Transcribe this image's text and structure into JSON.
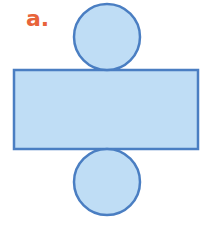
{
  "figure": {
    "label": "a.",
    "label_color": "#E8643A",
    "fill_color": "#BFDDF5",
    "stroke_color": "#4A7EC2",
    "shapes": [
      {
        "type": "circle",
        "role": "top-base",
        "cx": 107,
        "cy": 37,
        "r": 33
      },
      {
        "type": "rect",
        "role": "lateral-surface",
        "x": 14,
        "y": 70,
        "width": 184,
        "height": 79
      },
      {
        "type": "circle",
        "role": "bottom-base",
        "cx": 107,
        "cy": 182,
        "r": 33
      }
    ]
  }
}
